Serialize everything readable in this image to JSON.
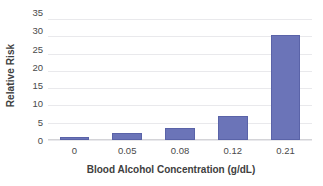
{
  "chart_data": {
    "type": "bar",
    "title": "",
    "xlabel": "Blood Alcohol Concentration (g/dL)",
    "ylabel": "Relative Risk",
    "categories": [
      "0",
      "0.05",
      "0.08",
      "0.12",
      "0.21"
    ],
    "values": [
      1,
      2,
      3.5,
      7,
      30.5
    ],
    "series": [
      {
        "name": "Relative Risk",
        "values": [
          1,
          2,
          3.5,
          7,
          30.5
        ]
      }
    ],
    "ylim": [
      0,
      35
    ],
    "ytick_labels": [
      "0",
      "5",
      "10",
      "15",
      "20",
      "25",
      "30",
      "35"
    ],
    "ytick_values": [
      0,
      5,
      10,
      15,
      20,
      25,
      30,
      35
    ],
    "grid": true,
    "legend": "none",
    "colors": {
      "bar_fill": "#6b74b8",
      "bar_border": "#5a63a8",
      "gridline": "#e9e9ec",
      "axis_line": "#d4d4d8",
      "tick_text": "#4a4a4a",
      "title_text": "#404040",
      "background": "#ffffff"
    }
  }
}
